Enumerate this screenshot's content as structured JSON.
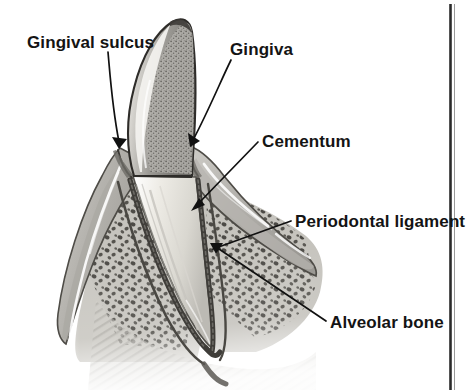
{
  "figure": {
    "style": "grayscale pencil/airbrush medical illustration",
    "background_color": "#ffffff",
    "ink_color": "#111111"
  },
  "labels": [
    {
      "id": "gingival-sulcus",
      "text": "Gingival sulcus",
      "text_x": 27,
      "text_y": 48,
      "anchor": "start",
      "leader_path": "M 108 52 C 110 74, 112 106, 119 142",
      "arrow_points": "119,149 113,138 126,139",
      "target": "gingival margin / sulcus at crown-gum junction"
    },
    {
      "id": "gingiva",
      "text": "Gingiva",
      "text_x": 230,
      "text_y": 55,
      "anchor": "start",
      "leader_path": "M 231 60 C 222 78, 208 112, 193 140",
      "arrow_points": "190,147 189,134 199,142",
      "target": "gum tissue over the alveolar crest"
    },
    {
      "id": "cementum",
      "text": "Cementum",
      "text_x": 262,
      "text_y": 147,
      "anchor": "start",
      "leader_path": "M 258 142 L 196 206",
      "arrow_points": "192,210 199,199 203,205",
      "target": "mineralized layer covering the root surface"
    },
    {
      "id": "periodontal-ligament",
      "text": "Periodontal ligament",
      "text_x": 295,
      "text_y": 227,
      "anchor": "start",
      "leader_path": "M 291 221 L 215 248",
      "arrow_points": "209,250 220,242, 222,249",
      "target": "fibrous attachment between root and bone"
    },
    {
      "id": "alveolar-bone",
      "text": "Alveolar bone",
      "text_x": 330,
      "text_y": 328,
      "anchor": "start",
      "leader_path": "M 326 321 L 216 247",
      "arrow_points": "211,244 223,244 218,253",
      "target": "trabecular bone of the tooth socket"
    }
  ],
  "page_edge": {
    "description": "dark vertical scan edge of the printed page",
    "x": 450,
    "y_top": 4,
    "y_bottom": 390,
    "color": "#2b2b2b"
  },
  "anatomy_regions": [
    {
      "id": "enamel-crown",
      "label": "enamel crown",
      "tone": "#a8a8a8",
      "texture": "dense stipple"
    },
    {
      "id": "root-dentin",
      "label": "root / dentin",
      "tone": "#e2e0da",
      "texture": "smooth shaded"
    },
    {
      "id": "gingiva-tissue",
      "label": "gingiva",
      "tone": "#b9b7b2",
      "texture": "soft wash with white highlight"
    },
    {
      "id": "alveolar-bone-mass",
      "label": "alveolar bone",
      "tone": "#c3c1bb",
      "texture": "trabecular speckles"
    },
    {
      "id": "pdl-space",
      "label": "periodontal ligament space",
      "tone": "#4a4843",
      "texture": "dark narrow band"
    }
  ]
}
